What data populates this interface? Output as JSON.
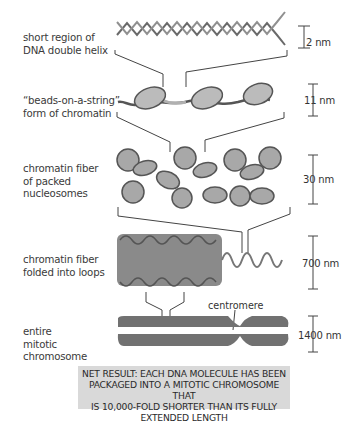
{
  "levels": [
    {
      "label": "short region of\nDNA double helix",
      "scale": "2 nm"
    },
    {
      "label": "“beads-on-a-string”\nform of chromatin",
      "scale": "11 nm"
    },
    {
      "label": "chromatin fiber\nof packed\nnucleosomes",
      "scale": "30 nm"
    },
    {
      "label": "chromatin fiber\nfolded into loops",
      "scale": "700 nm"
    },
    {
      "label": "entire\nmitotic\nchromosome",
      "scale": "1400 nm"
    }
  ],
  "annotations": {
    "centromere": "centromere"
  },
  "net_result": {
    "lines": [
      "NET RESULT: EACH DNA MOLECULE HAS BEEN",
      "PACKAGED INTO A MITOTIC CHROMOSOME THAT",
      "IS 10,000-FOLD SHORTER THAN ITS FULLY",
      "EXTENDED LENGTH"
    ]
  },
  "colors": {
    "strand": "#666666",
    "histone": "#b8b8b8",
    "chromosome": "#707070",
    "box": "#d9d9d9"
  }
}
